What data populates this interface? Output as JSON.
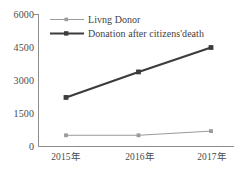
{
  "chart_data": {
    "type": "line",
    "title": "",
    "subtitle": "",
    "xlabel": "",
    "ylabel": "",
    "categories": [
      "2015年",
      "2016年",
      "2017年"
    ],
    "ylim": [
      0,
      6000
    ],
    "yticks": [
      0,
      1500,
      3000,
      4500,
      6000
    ],
    "ytick_labels": [
      "0",
      "1500",
      "3000",
      "4500",
      "6000"
    ],
    "grid": false,
    "legend_position": "top-left",
    "series": [
      {
        "name": "Livng Donor",
        "values": [
          510,
          510,
          700
        ],
        "color": "#9a9a9a",
        "marker": "square",
        "line_width": 1
      },
      {
        "name": "Donation after citizens'death",
        "values": [
          2230,
          3390,
          4500
        ],
        "color": "#3c3c3c",
        "marker": "square",
        "line_width": 2.2
      }
    ]
  },
  "axis": {
    "line_color": "#8c8c8c",
    "arrow": true
  },
  "legend": {
    "entries": [
      {
        "label": "Livng Donor",
        "color": "#9a9a9a"
      },
      {
        "label": "Donation after citizens'death",
        "color": "#3c3c3c"
      }
    ]
  }
}
